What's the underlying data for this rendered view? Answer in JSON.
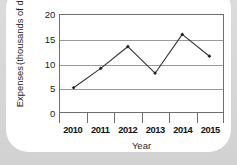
{
  "chart_data": {
    "type": "line",
    "title": "",
    "xlabel": "Year",
    "ylabel": "Expenses (thousands of dollars)",
    "ylabel_lines": [
      "Expenses",
      "(thousands of dollars)"
    ],
    "categories": [
      "2010",
      "2011",
      "2012",
      "2013",
      "2014",
      "2015"
    ],
    "values": [
      5,
      9,
      13.5,
      8,
      16,
      11.5
    ],
    "ylim": [
      0,
      20
    ],
    "yticks": [
      0,
      5,
      10,
      15,
      20
    ],
    "ytick_labels": [
      "0",
      "5",
      "10",
      "15",
      "20"
    ],
    "grid": true,
    "grid_axis": "y",
    "legend": "none",
    "marker": "diamond",
    "line_color": "#333333",
    "marker_color": "#222222",
    "grid_color": "#9a9a9a",
    "axis_color": "#6e6e6e",
    "plot_background": "#ffffff",
    "card_background": "#ffffff",
    "page_background": "#d9d9d9"
  }
}
